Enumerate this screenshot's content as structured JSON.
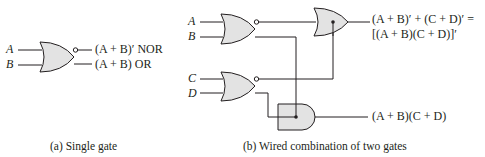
{
  "colors": {
    "gate_fill": "#e3e3e3",
    "stroke": "#231f20",
    "background": "#ffffff"
  },
  "panel_a": {
    "inputs": [
      "A",
      "B"
    ],
    "gate": "NOR/OR dual-output gate",
    "output_nor": "(A + B)′ NOR",
    "output_or": "(A + B) OR",
    "caption": "(a) Single gate"
  },
  "panel_b": {
    "inputs": [
      "A",
      "B",
      "C",
      "D"
    ],
    "gates": [
      "NOR/OR gate (A,B)",
      "NOR/OR gate (C,D)",
      "wired-OR (dot)",
      "wired-AND (dot)"
    ],
    "output_top_line1": "(A + B)′ + (C + D)′ =",
    "output_top_line2": "[(A + B)(C + D)]′",
    "output_bottom": "(A + B)(C + D)",
    "caption": "(b) Wired combination of two gates"
  }
}
